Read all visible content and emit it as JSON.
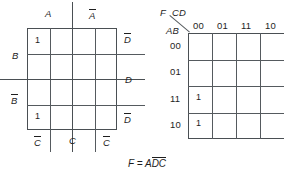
{
  "figure": {
    "type": "logic-diagram-pair",
    "caption_formula_prefix": "F =",
    "caption_formula_term_plain": "A",
    "caption_formula_term_barred": "DC"
  },
  "veitch": {
    "name": "veitch-diagram",
    "top_labels": [
      {
        "text": "A",
        "barred": false
      },
      {
        "text": "A",
        "barred": true
      }
    ],
    "left_labels": [
      {
        "text": "B",
        "barred": false
      },
      {
        "text": "B",
        "barred": true
      }
    ],
    "right_labels": [
      {
        "text": "D",
        "barred": true
      },
      {
        "text": "D",
        "barred": false
      },
      {
        "text": "D",
        "barred": true
      }
    ],
    "bottom_labels": [
      {
        "text": "C",
        "barred": true
      },
      {
        "text": "C",
        "barred": false
      },
      {
        "text": "C",
        "barred": true
      }
    ],
    "grid": {
      "rows": 4,
      "cols": 4
    },
    "entries": [
      {
        "row": 0,
        "col": 0,
        "value": "1"
      },
      {
        "row": 3,
        "col": 0,
        "value": "1"
      }
    ]
  },
  "karnaugh": {
    "name": "karnaugh-map",
    "output_label": "F",
    "col_var_label": "CD",
    "row_var_label": "AB",
    "col_headers": [
      "00",
      "01",
      "11",
      "10"
    ],
    "row_headers": [
      "00",
      "01",
      "11",
      "10"
    ],
    "grid": {
      "rows": 4,
      "cols": 4
    },
    "entries": [
      {
        "row": 2,
        "col": 0,
        "value": "1"
      },
      {
        "row": 3,
        "col": 0,
        "value": "1"
      }
    ]
  },
  "colors": {
    "ink": "#1e1e1e",
    "rule": "#555a5e",
    "frame": "#4a4f53",
    "background": "#ffffff"
  }
}
